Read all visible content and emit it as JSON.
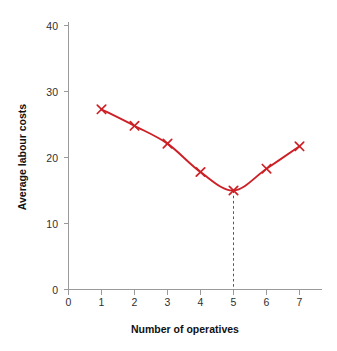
{
  "chart_data": {
    "type": "line",
    "title": "",
    "xlabel": "Number of operatives",
    "ylabel": "Average labour costs",
    "x": [
      1,
      2,
      3,
      4,
      5,
      6,
      7
    ],
    "values": [
      27.3,
      24.8,
      22.1,
      17.8,
      15.0,
      18.3,
      21.7
    ],
    "series": [
      {
        "name": "Average labour costs",
        "values": [
          27.3,
          24.8,
          22.1,
          17.8,
          15.0,
          18.3,
          21.7
        ]
      }
    ],
    "xlim": [
      0,
      7.6
    ],
    "ylim": [
      0,
      42
    ],
    "xticks": [
      0,
      1,
      2,
      3,
      4,
      5,
      6,
      7
    ],
    "yticks": [
      0,
      10,
      20,
      30,
      40
    ],
    "xticklabels": [
      "0",
      "1",
      "2",
      "3",
      "4",
      "5",
      "6",
      "7"
    ],
    "yticklabels": [
      "0",
      "10",
      "20",
      "30",
      "40"
    ],
    "grid": false,
    "legend": null,
    "marker": "x",
    "line_color": "#CC2026",
    "marker_color": "#CC2026",
    "axis_color": "#9A9A9A",
    "annotations": [
      {
        "type": "drop-line",
        "style": "dashed",
        "x": 5,
        "y_from": 15.0,
        "y_to": 0,
        "color": "#555555",
        "label": "minimum-at-5"
      }
    ]
  },
  "labels": {
    "y_axis_title": "Average labour costs",
    "x_axis_title": "Number of operatives"
  }
}
